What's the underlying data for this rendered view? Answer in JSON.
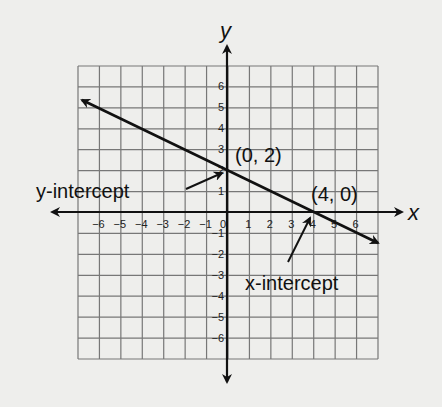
{
  "diagram": {
    "type": "coordinate-plane-line",
    "x_axis_label": "x",
    "y_axis_label": "y",
    "x_range": [
      -7,
      7
    ],
    "y_range": [
      -7,
      7
    ],
    "x_ticks": [
      "-6",
      "-5",
      "-4",
      "-3",
      "-2",
      "-1",
      "0",
      "1",
      "2",
      "3",
      "4",
      "5",
      "6"
    ],
    "y_ticks": [
      "6",
      "5",
      "4",
      "3",
      "2",
      "1",
      "-1",
      "-2",
      "-3",
      "-4",
      "-5",
      "-6"
    ],
    "line": {
      "slope": -0.5,
      "intercept": 2,
      "from": [
        -7,
        5.5
      ],
      "to": [
        7,
        -1.5
      ]
    },
    "points": [
      {
        "label": "(0, 2)",
        "x": 0,
        "y": 2
      },
      {
        "label": "(4, 0)",
        "x": 4,
        "y": 0
      }
    ],
    "annotations": {
      "y_intercept": "y-intercept",
      "x_intercept": "x-intercept"
    }
  }
}
